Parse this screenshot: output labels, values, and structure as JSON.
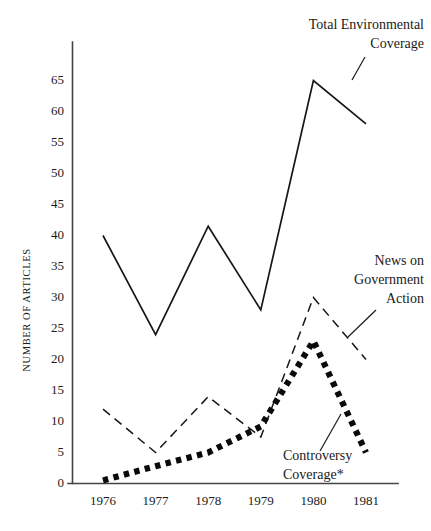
{
  "chart_data": {
    "type": "line",
    "title": "",
    "xlabel": "",
    "ylabel": "NUMBER OF ARTICLES",
    "categories": [
      "1976",
      "1977",
      "1978",
      "1979",
      "1980",
      "1981"
    ],
    "x": [
      1976,
      1977,
      1978,
      1979,
      1980,
      1981
    ],
    "xlim": [
      1975.6,
      1981.7
    ],
    "ylim": [
      0,
      68
    ],
    "y_ticks": [
      0,
      5,
      10,
      15,
      20,
      25,
      30,
      35,
      40,
      45,
      50,
      55,
      60,
      65
    ],
    "y_tick_labels": [
      "0",
      "5",
      "10",
      "15",
      "20",
      "25",
      "30",
      "35",
      "40",
      "45",
      "50",
      "55",
      "60",
      "65"
    ],
    "grid": false,
    "legend": "annotations-inline",
    "series": [
      {
        "name": "Total Environmental Coverage",
        "style": "solid",
        "values": [
          40,
          24,
          41.5,
          28,
          65,
          58
        ]
      },
      {
        "name": "News on Government Action",
        "style": "dashed",
        "values": [
          12,
          5,
          14,
          7.5,
          30,
          20
        ]
      },
      {
        "name": "Controversy Coverage*",
        "style": "dotted",
        "values": [
          0.5,
          2.8,
          5,
          9.2,
          23,
          5
        ]
      }
    ],
    "annotations": [
      {
        "id": "total-environmental-coverage",
        "lines": [
          "Total Environmental",
          "Coverage"
        ],
        "align": "end",
        "text_x": 424,
        "text_y": 29,
        "line_height": 19,
        "leader": {
          "x1": 352,
          "y1": 80,
          "x2": 365,
          "y2": 57
        }
      },
      {
        "id": "news-on-government-action",
        "lines": [
          "News on",
          "Government",
          "Action"
        ],
        "align": "end",
        "text_x": 424,
        "text_y": 265,
        "line_height": 19,
        "leader": {
          "x1": 348,
          "y1": 337,
          "x2": 376,
          "y2": 310
        }
      },
      {
        "id": "controversy-coverage",
        "lines": [
          "Controversy",
          "Coverage*"
        ],
        "align": "start",
        "text_x": 283,
        "text_y": 460,
        "line_height": 19,
        "leader": {
          "x1": 320,
          "y1": 451,
          "x2": 341,
          "y2": 414
        }
      }
    ]
  },
  "axes": {
    "y_axis_label": "NUMBER OF ARTICLES",
    "x_tick_labels": [
      "1976",
      "1977",
      "1978",
      "1979",
      "1980",
      "1981"
    ],
    "y_tick_labels": [
      "0",
      "5",
      "10",
      "15",
      "20",
      "25",
      "30",
      "35",
      "40",
      "45",
      "50",
      "55",
      "60",
      "65"
    ]
  },
  "colors": {
    "background": "#ffffff",
    "ink": "#161616",
    "axis": "#444444"
  }
}
